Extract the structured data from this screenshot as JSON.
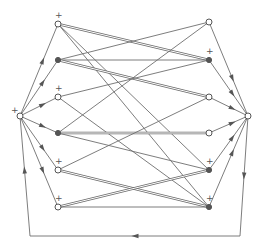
{
  "diagram": {
    "type": "directed-graph",
    "colors": {
      "line": "#6e6e6e",
      "node": "#555555",
      "background": "#ffffff"
    },
    "hubs": [
      {
        "id": "L",
        "x": 20,
        "y": 116,
        "style": "open",
        "marker": "+"
      },
      {
        "id": "R",
        "x": 248,
        "y": 116,
        "style": "open",
        "marker": ""
      }
    ],
    "left_nodes": [
      {
        "id": "L1",
        "x": 58,
        "y": 24,
        "style": "open",
        "marker": "+"
      },
      {
        "id": "L2",
        "x": 58,
        "y": 60,
        "style": "filled",
        "marker": ""
      },
      {
        "id": "L3",
        "x": 58,
        "y": 97,
        "style": "open",
        "marker": "+"
      },
      {
        "id": "L4",
        "x": 58,
        "y": 133,
        "style": "filled",
        "marker": ""
      },
      {
        "id": "L5",
        "x": 58,
        "y": 170,
        "style": "open",
        "marker": "+"
      },
      {
        "id": "L6",
        "x": 58,
        "y": 207,
        "style": "open",
        "marker": "+"
      }
    ],
    "right_nodes": [
      {
        "id": "R1",
        "x": 209,
        "y": 22,
        "style": "open",
        "marker": ""
      },
      {
        "id": "R2",
        "x": 209,
        "y": 60,
        "style": "filled",
        "marker": "+"
      },
      {
        "id": "R3",
        "x": 209,
        "y": 97,
        "style": "open",
        "marker": ""
      },
      {
        "id": "R4",
        "x": 209,
        "y": 133,
        "style": "open",
        "marker": ""
      },
      {
        "id": "R5",
        "x": 209,
        "y": 170,
        "style": "filled",
        "marker": "+"
      },
      {
        "id": "R6",
        "x": 209,
        "y": 207,
        "style": "filled",
        "marker": "+"
      }
    ],
    "edges": [
      {
        "from": "L1",
        "to": "R2",
        "kind": "double"
      },
      {
        "from": "L1",
        "to": "R5",
        "kind": "single"
      },
      {
        "from": "L1",
        "to": "R6",
        "kind": "single"
      },
      {
        "from": "L2",
        "to": "R1",
        "kind": "single"
      },
      {
        "from": "L2",
        "to": "R2",
        "kind": "single"
      },
      {
        "from": "L2",
        "to": "R3",
        "kind": "double"
      },
      {
        "from": "L3",
        "to": "R2",
        "kind": "single"
      },
      {
        "from": "L3",
        "to": "R6",
        "kind": "single"
      },
      {
        "from": "L4",
        "to": "R1",
        "kind": "single"
      },
      {
        "from": "L4",
        "to": "R4",
        "kind": "double"
      },
      {
        "from": "L4",
        "to": "R5",
        "kind": "single"
      },
      {
        "from": "L5",
        "to": "R3",
        "kind": "single"
      },
      {
        "from": "L5",
        "to": "R6",
        "kind": "double"
      },
      {
        "from": "L6",
        "to": "R5",
        "kind": "double"
      },
      {
        "from": "L6",
        "to": "R6",
        "kind": "single"
      }
    ],
    "hub_edges": [
      {
        "from": "L",
        "to": "L1"
      },
      {
        "from": "L",
        "to": "L2"
      },
      {
        "from": "L",
        "to": "L3"
      },
      {
        "from": "L",
        "to": "L4"
      },
      {
        "from": "L",
        "to": "L5"
      },
      {
        "from": "L",
        "to": "L6"
      },
      {
        "from": "R1",
        "to": "R"
      },
      {
        "from": "R2",
        "to": "R"
      },
      {
        "from": "R3",
        "to": "R"
      },
      {
        "from": "R4",
        "to": "R"
      },
      {
        "from": "R5",
        "to": "R"
      },
      {
        "from": "R6",
        "to": "R"
      }
    ],
    "feedback_loop": {
      "points": [
        [
          248,
          116
        ],
        [
          240,
          236
        ],
        [
          30,
          236
        ],
        [
          20,
          116
        ]
      ],
      "direction": "R to L via bottom"
    }
  }
}
